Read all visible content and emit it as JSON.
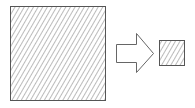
{
  "diagram": {
    "colors": {
      "stroke": "#555555",
      "hatch": "#777777",
      "background": "#ffffff"
    },
    "large_square": {
      "x": 10,
      "y": 6,
      "size": 95
    },
    "arrow": {
      "direction": "right"
    },
    "small_square": {
      "x": 159,
      "y": 40,
      "size": 25
    }
  }
}
